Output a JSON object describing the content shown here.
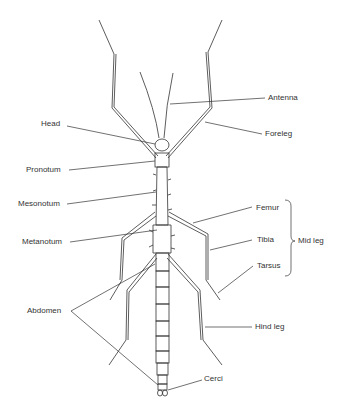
{
  "diagram": {
    "labels": {
      "antenna": "Antenna",
      "head": "Head",
      "foreleg": "Foreleg",
      "pronotum": "Pronotum",
      "mesonotum": "Mesonotum",
      "metanotum": "Metanotum",
      "femur": "Femur",
      "tibia": "Tibia",
      "tarsus": "Tarsus",
      "mid_leg": "Mid leg",
      "abdomen": "Abdomen",
      "hind_leg": "Hind leg",
      "cerci": "Cerci"
    },
    "colors": {
      "line": "#333333",
      "background": "#ffffff"
    }
  }
}
